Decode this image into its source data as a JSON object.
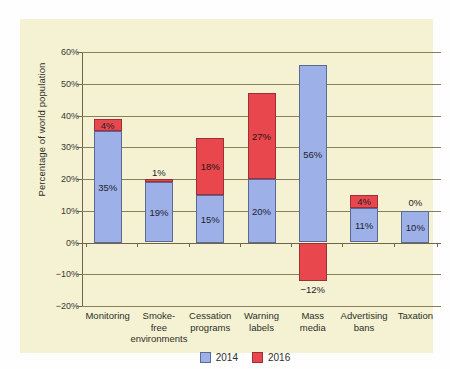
{
  "chart_data": {
    "type": "bar",
    "subtype": "stacked-with-negative",
    "title": "",
    "xlabel": "",
    "ylabel": "Percentage of world population",
    "ylim": [
      -20,
      60
    ],
    "ytick_labels": [
      "60%",
      "50%",
      "40%",
      "30%",
      "20%",
      "10%",
      "0%",
      "−10%",
      "−20%"
    ],
    "ytick_values": [
      60,
      50,
      40,
      30,
      20,
      10,
      0,
      -10,
      -20
    ],
    "grid": true,
    "legend_position": "bottom-center",
    "categories": [
      "Monitoring",
      "Smoke-free environments",
      "Cessation programs",
      "Warning labels",
      "Mass media",
      "Advertising bans",
      "Taxation"
    ],
    "category_lines": [
      [
        "Monitoring"
      ],
      [
        "Smoke-",
        "free",
        "environments"
      ],
      [
        "Cessation",
        "programs"
      ],
      [
        "Warning",
        "labels"
      ],
      [
        "Mass",
        "media"
      ],
      [
        "Advertising",
        "bans"
      ],
      [
        "Taxation"
      ]
    ],
    "series": [
      {
        "name": "2014",
        "color": "#9db0e8",
        "values": [
          35,
          19,
          15,
          20,
          56,
          11,
          10
        ],
        "value_labels": [
          "35%",
          "19%",
          "15%",
          "20%",
          "56%",
          "11%",
          "10%"
        ]
      },
      {
        "name": "2016",
        "color": "#e8474e",
        "values": [
          4,
          1,
          18,
          27,
          -12,
          4,
          0
        ],
        "value_labels": [
          "4%",
          "1%",
          "18%",
          "27%",
          "−12%",
          "4%",
          "0%"
        ]
      }
    ],
    "bars": [
      {
        "category": "Monitoring",
        "blue": {
          "value": 35,
          "label": "35%",
          "label_inside": true
        },
        "red": {
          "value": 4,
          "label": "4%",
          "label_inside": true
        }
      },
      {
        "category": "Smoke-free environments",
        "blue": {
          "value": 19,
          "label": "19%",
          "label_inside": true
        },
        "red": {
          "value": 1,
          "label": "1%",
          "label_inside": false
        }
      },
      {
        "category": "Cessation programs",
        "blue": {
          "value": 15,
          "label": "15%",
          "label_inside": true
        },
        "red": {
          "value": 18,
          "label": "18%",
          "label_inside": true
        }
      },
      {
        "category": "Warning labels",
        "blue": {
          "value": 20,
          "label": "20%",
          "label_inside": true
        },
        "red": {
          "value": 27,
          "label": "27%",
          "label_inside": true
        }
      },
      {
        "category": "Mass media",
        "blue": {
          "value": 56,
          "label": "56%",
          "label_inside": true
        },
        "red": {
          "value": -12,
          "label": "−12%",
          "label_inside": false
        }
      },
      {
        "category": "Advertising bans",
        "blue": {
          "value": 11,
          "label": "11%",
          "label_inside": true
        },
        "red": {
          "value": 4,
          "label": "4%",
          "label_inside": true
        }
      },
      {
        "category": "Taxation",
        "blue": {
          "value": 10,
          "label": "10%",
          "label_inside": true
        },
        "red": {
          "value": 0,
          "label": "0%",
          "label_inside": false
        }
      }
    ],
    "legend": [
      {
        "label": "2014",
        "color": "#9db0e8"
      },
      {
        "label": "2016",
        "color": "#e8474e"
      }
    ],
    "colors": {
      "series_2014": "#9db0e8",
      "series_2016": "#e8474e",
      "panel_background": "#f4f2d2",
      "gridline": "#8a7f5a",
      "axis": "#6f6647",
      "text": "#2f2f2a"
    }
  }
}
